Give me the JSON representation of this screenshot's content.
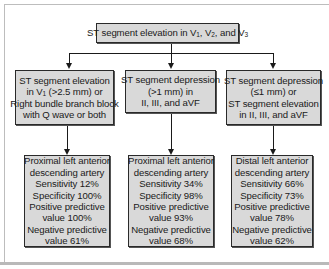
{
  "diagram": {
    "type": "flowchart",
    "root": {
      "label_parts": [
        "ST segment elevation in V",
        "1",
        ", V",
        "2",
        ", and V",
        "3"
      ]
    },
    "branches": [
      {
        "criteria": {
          "lines": [
            "ST segment elevation",
            "in V",
            "1",
            " (>2.5 mm) or",
            "Right bundle branch block",
            "with Q wave or both"
          ]
        },
        "result": {
          "location_lines": [
            "Proximal left anterior",
            "descending artery"
          ],
          "sensitivity": "Sensitivity 12%",
          "specificity": "Specificity 100%",
          "ppv_line1": "Positive predictive",
          "ppv_line2": "value 100%",
          "npv_line1": "Negative predictive",
          "npv_line2": "value 61%"
        }
      },
      {
        "criteria": {
          "lines": [
            "ST segment depression",
            "(>1 mm) in",
            "II, III, and aVF"
          ]
        },
        "result": {
          "location_lines": [
            "Proximal left anterior",
            "descending artery"
          ],
          "sensitivity": "Sensitivity 34%",
          "specificity": "Specificity 98%",
          "ppv_line1": "Positive predictive",
          "ppv_line2": "value 93%",
          "npv_line1": "Negative predictive",
          "npv_line2": "value 68%"
        }
      },
      {
        "criteria": {
          "lines": [
            "ST segment depression",
            "(≤1 mm) or",
            "ST segment elevation",
            "in II, III, and aVF"
          ]
        },
        "result": {
          "location_lines": [
            "Distal left anterior",
            "descending artery"
          ],
          "sensitivity": "Sensitivity 66%",
          "specificity": "Specificity 73%",
          "ppv_line1": "Positive predictive",
          "ppv_line2": "value 78%",
          "npv_line1": "Negative predictive",
          "npv_line2": "value 62%"
        }
      }
    ]
  },
  "colors": {
    "box_fill": "#d9d9d9",
    "box_border": "#2a2a2a",
    "connector": "#1a1a1a",
    "background": "#ffffff"
  }
}
